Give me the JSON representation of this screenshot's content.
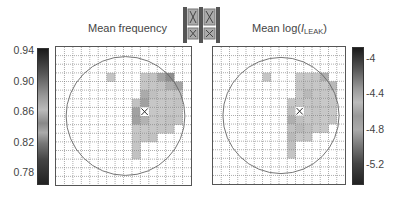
{
  "chart_data": [
    {
      "type": "heatmap",
      "title": "Mean frequency",
      "grid": {
        "rows": 16,
        "cols": 16,
        "gridlines": true
      },
      "colorbar": {
        "position": "left",
        "ticks": [
          "0.94",
          "0.90",
          "0.86",
          "0.82",
          "0.78"
        ],
        "range": [
          0.77,
          0.95
        ],
        "colormap": "gray"
      },
      "overlay": "wafer-circle",
      "marker": {
        "type": "X",
        "row": 7,
        "col": 10
      },
      "cells": [
        {
          "row": 3,
          "col": 6,
          "value": 0.87
        },
        {
          "row": 3,
          "col": 10,
          "value": 0.87
        },
        {
          "row": 3,
          "col": 11,
          "value": 0.88
        },
        {
          "row": 3,
          "col": 12,
          "value": 0.92
        },
        {
          "row": 3,
          "col": 13,
          "value": 0.94
        },
        {
          "row": 4,
          "col": 10,
          "value": 0.87
        },
        {
          "row": 4,
          "col": 11,
          "value": 0.87
        },
        {
          "row": 4,
          "col": 12,
          "value": 0.88
        },
        {
          "row": 4,
          "col": 13,
          "value": 0.91
        },
        {
          "row": 4,
          "col": 14,
          "value": 0.92
        },
        {
          "row": 5,
          "col": 10,
          "value": 0.79
        },
        {
          "row": 5,
          "col": 11,
          "value": 0.82
        },
        {
          "row": 5,
          "col": 12,
          "value": 0.86
        },
        {
          "row": 5,
          "col": 13,
          "value": 0.86
        },
        {
          "row": 5,
          "col": 14,
          "value": 0.87
        },
        {
          "row": 6,
          "col": 9,
          "value": 0.88
        },
        {
          "row": 6,
          "col": 10,
          "value": 0.78
        },
        {
          "row": 6,
          "col": 11,
          "value": 0.86
        },
        {
          "row": 6,
          "col": 12,
          "value": 0.86
        },
        {
          "row": 6,
          "col": 13,
          "value": 0.87
        },
        {
          "row": 6,
          "col": 14,
          "value": 0.88
        },
        {
          "row": 7,
          "col": 9,
          "value": 0.78
        },
        {
          "row": 7,
          "col": 11,
          "value": 0.86
        },
        {
          "row": 7,
          "col": 12,
          "value": 0.86
        },
        {
          "row": 7,
          "col": 13,
          "value": 0.87
        },
        {
          "row": 7,
          "col": 14,
          "value": 0.87
        },
        {
          "row": 8,
          "col": 9,
          "value": 0.78
        },
        {
          "row": 8,
          "col": 10,
          "value": 0.8
        },
        {
          "row": 8,
          "col": 11,
          "value": 0.86
        },
        {
          "row": 8,
          "col": 12,
          "value": 0.87
        },
        {
          "row": 8,
          "col": 13,
          "value": 0.88
        },
        {
          "row": 8,
          "col": 14,
          "value": 0.87
        },
        {
          "row": 9,
          "col": 9,
          "value": 0.86
        },
        {
          "row": 9,
          "col": 10,
          "value": 0.86
        },
        {
          "row": 9,
          "col": 11,
          "value": 0.86
        },
        {
          "row": 9,
          "col": 12,
          "value": 0.87
        },
        {
          "row": 9,
          "col": 13,
          "value": 0.87
        },
        {
          "row": 10,
          "col": 9,
          "value": 0.87
        },
        {
          "row": 10,
          "col": 10,
          "value": 0.87
        },
        {
          "row": 10,
          "col": 11,
          "value": 0.88
        },
        {
          "row": 11,
          "col": 9,
          "value": 0.87
        },
        {
          "row": 12,
          "col": 9,
          "value": 0.88
        }
      ]
    },
    {
      "type": "heatmap",
      "title": "Mean log(I_LEAK)",
      "grid": {
        "rows": 16,
        "cols": 16,
        "gridlines": true
      },
      "colorbar": {
        "position": "right",
        "ticks": [
          "-4",
          "-4.4",
          "-4.8",
          "-5.2"
        ],
        "range": [
          -5.3,
          -3.85
        ],
        "colormap": "gray"
      },
      "overlay": "wafer-circle",
      "marker": {
        "type": "X",
        "row": 7,
        "col": 10
      },
      "cells": [
        {
          "row": 3,
          "col": 6,
          "value": -4.5
        },
        {
          "row": 3,
          "col": 10,
          "value": -4.6
        },
        {
          "row": 3,
          "col": 11,
          "value": -4.55
        },
        {
          "row": 3,
          "col": 12,
          "value": -4.8
        },
        {
          "row": 3,
          "col": 13,
          "value": -5.1
        },
        {
          "row": 4,
          "col": 10,
          "value": -4.45
        },
        {
          "row": 4,
          "col": 11,
          "value": -4.45
        },
        {
          "row": 4,
          "col": 12,
          "value": -4.5
        },
        {
          "row": 4,
          "col": 13,
          "value": -4.55
        },
        {
          "row": 4,
          "col": 14,
          "value": -5.0
        },
        {
          "row": 5,
          "col": 10,
          "value": -4.6
        },
        {
          "row": 5,
          "col": 11,
          "value": -5.0
        },
        {
          "row": 5,
          "col": 12,
          "value": -4.5
        },
        {
          "row": 5,
          "col": 13,
          "value": -4.5
        },
        {
          "row": 5,
          "col": 14,
          "value": -4.6
        },
        {
          "row": 6,
          "col": 9,
          "value": -4.6
        },
        {
          "row": 6,
          "col": 10,
          "value": -4.8
        },
        {
          "row": 6,
          "col": 11,
          "value": -4.5
        },
        {
          "row": 6,
          "col": 12,
          "value": -4.8
        },
        {
          "row": 6,
          "col": 13,
          "value": -4.6
        },
        {
          "row": 6,
          "col": 14,
          "value": -4.5
        },
        {
          "row": 7,
          "col": 9,
          "value": -4.9
        },
        {
          "row": 7,
          "col": 11,
          "value": -4.6
        },
        {
          "row": 7,
          "col": 12,
          "value": -4.8
        },
        {
          "row": 7,
          "col": 13,
          "value": -4.55
        },
        {
          "row": 7,
          "col": 14,
          "value": -4.6
        },
        {
          "row": 8,
          "col": 9,
          "value": -5.1
        },
        {
          "row": 8,
          "col": 10,
          "value": -4.9
        },
        {
          "row": 8,
          "col": 11,
          "value": -4.5
        },
        {
          "row": 8,
          "col": 12,
          "value": -4.8
        },
        {
          "row": 8,
          "col": 13,
          "value": -4.6
        },
        {
          "row": 8,
          "col": 14,
          "value": -4.8
        },
        {
          "row": 9,
          "col": 9,
          "value": -4.9
        },
        {
          "row": 9,
          "col": 10,
          "value": -5.0
        },
        {
          "row": 9,
          "col": 11,
          "value": -4.9
        },
        {
          "row": 9,
          "col": 12,
          "value": -4.6
        },
        {
          "row": 9,
          "col": 13,
          "value": -4.55
        },
        {
          "row": 10,
          "col": 9,
          "value": -5.0
        },
        {
          "row": 10,
          "col": 10,
          "value": -4.5
        },
        {
          "row": 10,
          "col": 11,
          "value": -4.8
        },
        {
          "row": 11,
          "col": 9,
          "value": -4.9
        },
        {
          "row": 12,
          "col": 9,
          "value": -4.8
        }
      ]
    }
  ],
  "panels": {
    "left": {
      "title": "Mean frequency",
      "ticks": [
        "0.94",
        "0.90",
        "0.86",
        "0.82",
        "0.78"
      ]
    },
    "right": {
      "title_prefix": "Mean log(",
      "title_italic": "I",
      "title_sub": "LEAK",
      "title_suffix": ")",
      "ticks": [
        "-4",
        "-4.4",
        "-4.8",
        "-5.2"
      ]
    }
  },
  "legend_icon": {
    "name": "die-layout-icon"
  }
}
